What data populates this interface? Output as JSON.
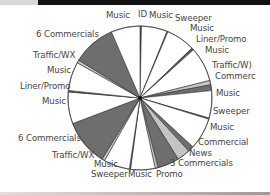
{
  "chart_data": {
    "type": "pie",
    "title": "",
    "start_angle_deg": 0,
    "direction": "clockwise",
    "colors": {
      "music": "#ffffff",
      "commercial": "#6e6e6e",
      "light": "#c4c4c4",
      "thin": "#555555",
      "outline": "#333333"
    },
    "slices": [
      {
        "label": "ID",
        "value": 1,
        "type": "thin"
      },
      {
        "label": "Music",
        "value": 18,
        "type": "music"
      },
      {
        "label": "Sweeper",
        "value": 0.6,
        "type": "thin"
      },
      {
        "label": "Music",
        "value": 20,
        "type": "music"
      },
      {
        "label": "Liner/Promo",
        "value": 1.5,
        "type": "thin"
      },
      {
        "label": "Music",
        "value": 24,
        "type": "music"
      },
      {
        "label": "Traffic/WX",
        "value": 3,
        "type": "light"
      },
      {
        "label": "Commercial",
        "value": 4,
        "type": "commercial"
      },
      {
        "label": "Music",
        "value": 19,
        "type": "music"
      },
      {
        "label": "Sweeper",
        "value": 0.8,
        "type": "thin"
      },
      {
        "label": "Music",
        "value": 22,
        "type": "music"
      },
      {
        "label": "Commercial",
        "value": 4,
        "type": "commercial"
      },
      {
        "label": "News",
        "value": 9,
        "type": "light"
      },
      {
        "label": "3 Commercials",
        "value": 15,
        "type": "commercial"
      },
      {
        "label": "Promo",
        "value": 2,
        "type": "light"
      },
      {
        "label": "Music",
        "value": 17,
        "type": "music"
      },
      {
        "label": "Sweeper",
        "value": 0.8,
        "type": "thin"
      },
      {
        "label": "Music",
        "value": 18,
        "type": "music"
      },
      {
        "label": "Traffic/WX",
        "value": 2,
        "type": "light"
      },
      {
        "label": "6 Commercials",
        "value": 32,
        "type": "commercial"
      },
      {
        "label": "Music",
        "value": 22,
        "type": "music"
      },
      {
        "label": "Liner/Promo",
        "value": 1,
        "type": "thin"
      },
      {
        "label": "Music",
        "value": 20,
        "type": "music"
      },
      {
        "label": "Traffic/WX",
        "value": 2,
        "type": "light"
      },
      {
        "label": "6 Commercials",
        "value": 30,
        "type": "commercial"
      },
      {
        "label": "Music",
        "value": 20,
        "type": "music"
      }
    ],
    "labels": [
      {
        "text": "Music",
        "x": 106,
        "y": 17
      },
      {
        "text": "ID",
        "x": 138,
        "y": 16
      },
      {
        "text": "Music",
        "x": 149,
        "y": 17
      },
      {
        "text": "Sweeper",
        "x": 175,
        "y": 20
      },
      {
        "text": "Music",
        "x": 190,
        "y": 30
      },
      {
        "text": "Liner/Promo",
        "x": 196,
        "y": 41
      },
      {
        "text": "Music",
        "x": 205,
        "y": 52
      },
      {
        "text": "Traffic/W)",
        "x": 212,
        "y": 67
      },
      {
        "text": "Commerc",
        "x": 215,
        "y": 78
      },
      {
        "text": "Music",
        "x": 216,
        "y": 95
      },
      {
        "text": "Sweeper",
        "x": 213,
        "y": 113
      },
      {
        "text": "Music",
        "x": 210,
        "y": 129
      },
      {
        "text": "Commercial",
        "x": 198,
        "y": 144
      },
      {
        "text": "News",
        "x": 189,
        "y": 155
      },
      {
        "text": "3 Commercials",
        "x": 170,
        "y": 165
      },
      {
        "text": "Promo",
        "x": 156,
        "y": 176
      },
      {
        "text": "Music",
        "x": 128,
        "y": 176
      },
      {
        "text": "Sweeper",
        "x": 91,
        "y": 176
      },
      {
        "text": "Music",
        "x": 94,
        "y": 166
      },
      {
        "text": "Traffic/WX",
        "x": 52,
        "y": 157
      },
      {
        "text": "6 Commercials",
        "x": 18,
        "y": 140
      },
      {
        "text": "Music",
        "x": 42,
        "y": 103
      },
      {
        "text": "Liner/Promo",
        "x": 20,
        "y": 88
      },
      {
        "text": "Music",
        "x": 47,
        "y": 72
      },
      {
        "text": "Traffic/WX",
        "x": 33,
        "y": 57
      },
      {
        "text": "6 Commercials",
        "x": 36,
        "y": 36
      }
    ]
  }
}
